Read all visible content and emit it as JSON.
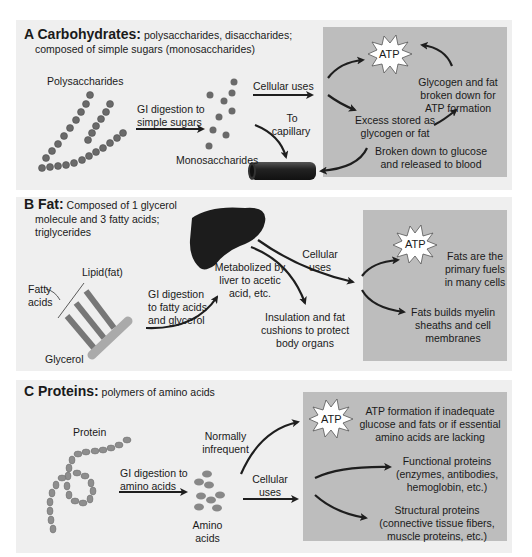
{
  "panels": {
    "carbohydrates": {
      "letter_title": "A Carbohydrates:",
      "subtitle_line1": "polysaccharides, disaccharides;",
      "subtitle_line2": "composed of simple sugars (monosaccharides)",
      "polysaccharides": "Polysaccharides",
      "gi_line1": "GI digestion to",
      "gi_line2": "simple sugars",
      "monosaccharides": "Monosaccharides",
      "cellular_uses": "Cellular uses",
      "to_cap_line1": "To",
      "to_cap_line2": "capillary",
      "atp": "ATP",
      "glycogen_line1": "Glycogen and fat",
      "glycogen_line2": "broken down for",
      "glycogen_line3": "ATP formation",
      "excess_line1": "Excess stored as",
      "excess_line2": "glycogen or fat",
      "broken_line1": "Broken down to glucose",
      "broken_line2": "and released to blood"
    },
    "fat": {
      "letter_title": "B Fat:",
      "subtitle_line1": "Composed of 1 glycerol",
      "subtitle_line2": "molecule and 3 fatty acids;",
      "subtitle_line3": "triglycerides",
      "lipid": "Lipid(fat)",
      "fatty_line1": "Fatty",
      "fatty_line2": "acids",
      "glycerol": "Glycerol",
      "gi_line1": "GI digestion",
      "gi_line2": "to fatty acids",
      "gi_line3": "and glycerol",
      "metab_line1": "Metabolized by",
      "metab_line2": "liver to acetic",
      "metab_line3": "acid, etc.",
      "cellular_line1": "Cellular",
      "cellular_line2": "uses",
      "insul_line1": "Insulation and fat",
      "insul_line2": "cushions to protect",
      "insul_line3": "body organs",
      "atp": "ATP",
      "fuels_line1": "Fats are the",
      "fuels_line2": "primary fuels",
      "fuels_line3": "in many cells",
      "myelin_line1": "Fats builds myelin",
      "myelin_line2": "sheaths and cell",
      "myelin_line3": "membranes"
    },
    "proteins": {
      "letter_title": "C Proteins:",
      "subtitle_line1": "polymers of amino acids",
      "protein": "Protein",
      "gi_line1": "GI digestion to",
      "gi_line2": "amino acids",
      "amino_line1": "Amino",
      "amino_line2": "acids",
      "normally_line1": "Normally",
      "normally_line2": "infrequent",
      "cellular_line1": "Cellular",
      "cellular_line2": "uses",
      "atp": "ATP",
      "atpform_line1": "ATP formation if inadequate",
      "atpform_line2": "glucose and fats or if essential",
      "atpform_line3": "amino acids are lacking",
      "functional_line1": "Functional proteins",
      "functional_line2": "(enzymes, antibodies,",
      "functional_line3": "hemoglobin, etc.)",
      "structural_line1": "Structural proteins",
      "structural_line2": "(connective tissue fibers,",
      "structural_line3": "muscle proteins, etc.)"
    }
  },
  "colors": {
    "panel_bg": "#efefef",
    "result_box": "#bdbdbd",
    "molecule": "#6e6e6e",
    "arrow": "#1e1e1e"
  }
}
